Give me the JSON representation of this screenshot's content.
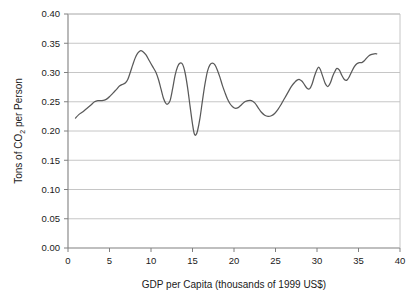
{
  "chart_data": {
    "type": "line",
    "title": "",
    "xlabel": "GDP per Capita (thousands of 1999 US$)",
    "ylabel_parts": {
      "pre": "Tons of CO",
      "sub": "2",
      "post": " per Person"
    },
    "ylabel": "Tons of CO2 per Person",
    "xlim": [
      0,
      40
    ],
    "ylim": [
      0.0,
      0.4
    ],
    "xticks": [
      0,
      5,
      10,
      15,
      20,
      25,
      30,
      35,
      40
    ],
    "xtick_labels": [
      "0",
      "5",
      "10",
      "15",
      "20",
      "25",
      "30",
      "35",
      "40"
    ],
    "yticks": [
      0.0,
      0.05,
      0.1,
      0.15,
      0.2,
      0.25,
      0.3,
      0.35,
      0.4
    ],
    "ytick_labels": [
      "0.00",
      "0.05",
      "0.10",
      "0.15",
      "0.20",
      "0.25",
      "0.30",
      "0.35",
      "0.40"
    ],
    "grid": "horizontal",
    "legend": "none",
    "line_color": "#595959",
    "grid_color": "#bfbfbf",
    "axis_color": "#808080",
    "series": [
      {
        "name": "CO2 per Person vs GDP per Capita",
        "points": [
          [
            0.9,
            0.222
          ],
          [
            1.3,
            0.228
          ],
          [
            1.8,
            0.233
          ],
          [
            2.3,
            0.239
          ],
          [
            2.8,
            0.245
          ],
          [
            3.2,
            0.25
          ],
          [
            3.6,
            0.252
          ],
          [
            4.1,
            0.252
          ],
          [
            4.6,
            0.254
          ],
          [
            5.1,
            0.26
          ],
          [
            5.5,
            0.266
          ],
          [
            5.9,
            0.272
          ],
          [
            6.2,
            0.277
          ],
          [
            6.6,
            0.28
          ],
          [
            6.9,
            0.282
          ],
          [
            7.2,
            0.288
          ],
          [
            7.5,
            0.3
          ],
          [
            7.8,
            0.313
          ],
          [
            8.1,
            0.325
          ],
          [
            8.4,
            0.333
          ],
          [
            8.7,
            0.337
          ],
          [
            9.0,
            0.336
          ],
          [
            9.4,
            0.33
          ],
          [
            9.8,
            0.32
          ],
          [
            10.2,
            0.31
          ],
          [
            10.6,
            0.3
          ],
          [
            10.9,
            0.288
          ],
          [
            11.2,
            0.272
          ],
          [
            11.5,
            0.256
          ],
          [
            11.8,
            0.247
          ],
          [
            12.0,
            0.246
          ],
          [
            12.3,
            0.252
          ],
          [
            12.6,
            0.272
          ],
          [
            12.9,
            0.295
          ],
          [
            13.2,
            0.31
          ],
          [
            13.5,
            0.316
          ],
          [
            13.8,
            0.314
          ],
          [
            14.1,
            0.3
          ],
          [
            14.4,
            0.275
          ],
          [
            14.7,
            0.243
          ],
          [
            15.0,
            0.212
          ],
          [
            15.2,
            0.196
          ],
          [
            15.4,
            0.193
          ],
          [
            15.6,
            0.2
          ],
          [
            15.9,
            0.222
          ],
          [
            16.2,
            0.252
          ],
          [
            16.5,
            0.28
          ],
          [
            16.8,
            0.302
          ],
          [
            17.1,
            0.313
          ],
          [
            17.4,
            0.316
          ],
          [
            17.7,
            0.313
          ],
          [
            18.0,
            0.304
          ],
          [
            18.3,
            0.292
          ],
          [
            18.6,
            0.278
          ],
          [
            18.9,
            0.266
          ],
          [
            19.2,
            0.255
          ],
          [
            19.5,
            0.247
          ],
          [
            19.8,
            0.242
          ],
          [
            20.1,
            0.239
          ],
          [
            20.5,
            0.24
          ],
          [
            20.9,
            0.245
          ],
          [
            21.3,
            0.25
          ],
          [
            21.7,
            0.252
          ],
          [
            22.1,
            0.252
          ],
          [
            22.5,
            0.248
          ],
          [
            22.9,
            0.24
          ],
          [
            23.3,
            0.232
          ],
          [
            23.7,
            0.227
          ],
          [
            24.1,
            0.225
          ],
          [
            24.5,
            0.226
          ],
          [
            24.9,
            0.23
          ],
          [
            25.3,
            0.237
          ],
          [
            25.7,
            0.246
          ],
          [
            26.1,
            0.256
          ],
          [
            26.5,
            0.266
          ],
          [
            26.9,
            0.276
          ],
          [
            27.3,
            0.283
          ],
          [
            27.6,
            0.287
          ],
          [
            27.9,
            0.288
          ],
          [
            28.2,
            0.285
          ],
          [
            28.5,
            0.279
          ],
          [
            28.8,
            0.273
          ],
          [
            29.1,
            0.272
          ],
          [
            29.4,
            0.28
          ],
          [
            29.7,
            0.294
          ],
          [
            30.0,
            0.305
          ],
          [
            30.2,
            0.309
          ],
          [
            30.4,
            0.305
          ],
          [
            30.7,
            0.293
          ],
          [
            31.0,
            0.281
          ],
          [
            31.3,
            0.276
          ],
          [
            31.6,
            0.282
          ],
          [
            31.9,
            0.294
          ],
          [
            32.2,
            0.303
          ],
          [
            32.4,
            0.307
          ],
          [
            32.7,
            0.304
          ],
          [
            33.0,
            0.295
          ],
          [
            33.3,
            0.288
          ],
          [
            33.6,
            0.287
          ],
          [
            33.9,
            0.293
          ],
          [
            34.2,
            0.302
          ],
          [
            34.5,
            0.31
          ],
          [
            34.8,
            0.315
          ],
          [
            35.1,
            0.317
          ],
          [
            35.4,
            0.317
          ],
          [
            35.7,
            0.32
          ],
          [
            36.0,
            0.325
          ],
          [
            36.3,
            0.329
          ],
          [
            36.6,
            0.331
          ],
          [
            36.9,
            0.332
          ],
          [
            37.2,
            0.332
          ]
        ]
      }
    ]
  }
}
